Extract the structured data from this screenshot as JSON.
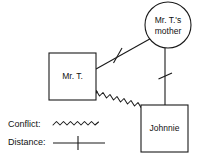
{
  "diagram": {
    "type": "genogram",
    "nodes": [
      {
        "id": "mother",
        "shape": "circle",
        "label_line1": "Mr. T.'s",
        "label_line2": "mother",
        "cx": 168,
        "cy": 25,
        "r": 23
      },
      {
        "id": "mr-t",
        "shape": "rect",
        "label": "Mr. T.",
        "x": 49,
        "y": 53,
        "w": 47,
        "h": 47
      },
      {
        "id": "johnnie",
        "shape": "rect",
        "label": "Johnnie",
        "x": 141,
        "y": 105,
        "w": 47,
        "h": 47
      }
    ],
    "links": [
      {
        "id": "mrt-mother",
        "from": "mr-t",
        "to": "mother",
        "relation": "Distance",
        "style": "line-with-tick"
      },
      {
        "id": "mother-johnnie",
        "from": "mother",
        "to": "johnnie",
        "relation": "Distance",
        "style": "line-with-tick"
      },
      {
        "id": "mrt-johnnie",
        "from": "johnnie",
        "to": "mr-t",
        "relation": "Conflict",
        "style": "wavy"
      }
    ]
  },
  "legend": {
    "items": [
      {
        "id": "conflict",
        "label": "Conflict:",
        "style": "wavy"
      },
      {
        "id": "distance",
        "label": "Distance:",
        "style": "line-with-tick"
      }
    ]
  },
  "colors": {
    "stroke": "#1a1a1a",
    "text": "#111111",
    "background": "#ffffff"
  }
}
